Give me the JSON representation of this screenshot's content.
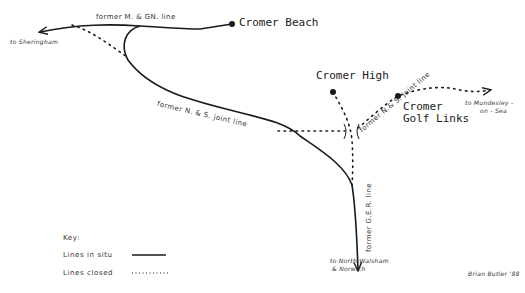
{
  "map": {
    "stations": [
      {
        "name": "Cromer Beach",
        "x": 232,
        "y": 24
      },
      {
        "name": "Cromer High",
        "x": 333,
        "y": 92
      },
      {
        "name": "Cromer Golf Links",
        "line1": "Cromer",
        "line2": "Golf Links",
        "x": 398,
        "y": 96
      }
    ],
    "line_labels": {
      "mgn": "former M. & GN. line",
      "ns_lower": "former N. & S.  joint line",
      "ns_upper": "former N.& S. joint line",
      "ger": "former G.E.R. line"
    },
    "destinations": {
      "sheringham": "to Sheringham",
      "mundesley_1": "to Mundesley -",
      "mundesley_2": "on - Sea",
      "north_walsham_1": "to North Walsham",
      "north_walsham_2": "& Norwich"
    },
    "key": {
      "title": "Key:",
      "in_situ": "Lines in situ",
      "closed": "Lines closed"
    },
    "credit": "Brian Butler '88",
    "colors": {
      "ink": "#1a1a1a",
      "paper": "#ffffff"
    }
  }
}
